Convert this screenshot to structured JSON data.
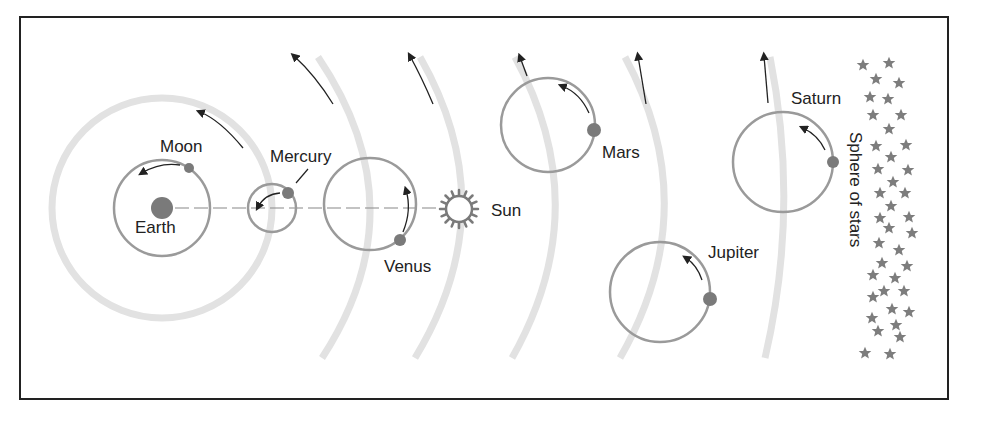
{
  "colors": {
    "frame": "#222222",
    "deferent": "#e2e2e2",
    "epicycle": "#9a9a9a",
    "planet": "#7a7a7a",
    "arrow": "#222222",
    "star": "#7d7d7d",
    "text": "#222222"
  },
  "labels": {
    "earth": "Earth",
    "moon": "Moon",
    "mercury": "Mercury",
    "venus": "Venus",
    "sun": "Sun",
    "mars": "Mars",
    "jupiter": "Jupiter",
    "saturn": "Saturn",
    "stars": "Sphere of stars"
  },
  "bodies": [
    {
      "name": "Earth",
      "x": 162,
      "y": 208
    },
    {
      "name": "Moon",
      "x": 189,
      "y": 168,
      "orbit_center": [
        162,
        208
      ],
      "orbit_radius": 48
    },
    {
      "name": "Mercury",
      "x": 288,
      "y": 193,
      "epicycle_center": [
        272,
        208
      ],
      "epicycle_radius": 24
    },
    {
      "name": "Venus",
      "x": 400,
      "y": 240,
      "epicycle_center": [
        370,
        204
      ],
      "epicycle_radius": 46
    },
    {
      "name": "Sun",
      "x": 459,
      "y": 209
    },
    {
      "name": "Mars",
      "x": 594,
      "y": 130,
      "epicycle_center": [
        548,
        125
      ],
      "epicycle_radius": 47
    },
    {
      "name": "Jupiter",
      "x": 710,
      "y": 299,
      "epicycle_center": [
        660,
        292
      ],
      "epicycle_radius": 50
    },
    {
      "name": "Saturn",
      "x": 833,
      "y": 162,
      "epicycle_center": [
        783,
        162
      ],
      "epicycle_radius": 50
    }
  ]
}
